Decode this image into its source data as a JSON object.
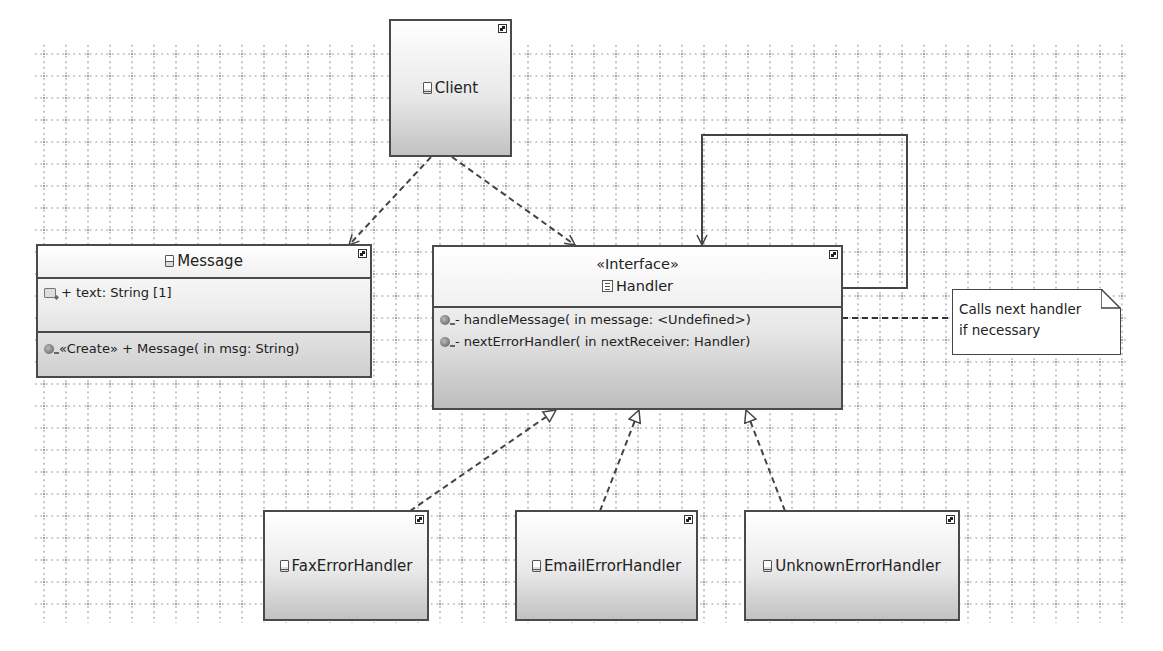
{
  "diagram": {
    "type": "UML class diagram",
    "nodes": {
      "client": {
        "name": "Client",
        "kind": "class"
      },
      "message": {
        "name": "Message",
        "kind": "class",
        "attributes": [
          "+ text: String [1]"
        ],
        "operations": [
          "«Create»  + Message(  in msg: String)"
        ]
      },
      "handler": {
        "stereotype": "«Interface»",
        "name": "Handler",
        "kind": "interface",
        "operations": [
          "- handleMessage(  in message: <Undefined>)",
          "- nextErrorHandler(  in nextReceiver: Handler)"
        ]
      },
      "fax": {
        "name": "FaxErrorHandler",
        "kind": "class"
      },
      "email": {
        "name": "EmailErrorHandler",
        "kind": "class"
      },
      "unknown": {
        "name": "UnknownErrorHandler",
        "kind": "class"
      }
    },
    "note": {
      "lines": [
        "Calls next handler",
        "if necessary"
      ]
    },
    "edges": [
      {
        "from": "Client",
        "to": "Message",
        "type": "dependency"
      },
      {
        "from": "Client",
        "to": "Handler",
        "type": "dependency"
      },
      {
        "from": "Handler",
        "to": "Handler",
        "type": "association (self)"
      },
      {
        "from": "FaxErrorHandler",
        "to": "Handler",
        "type": "realization"
      },
      {
        "from": "EmailErrorHandler",
        "to": "Handler",
        "type": "realization"
      },
      {
        "from": "UnknownErrorHandler",
        "to": "Handler",
        "type": "realization"
      },
      {
        "from": "Note",
        "to": "Handler.handleMessage",
        "type": "note-anchor"
      }
    ]
  }
}
